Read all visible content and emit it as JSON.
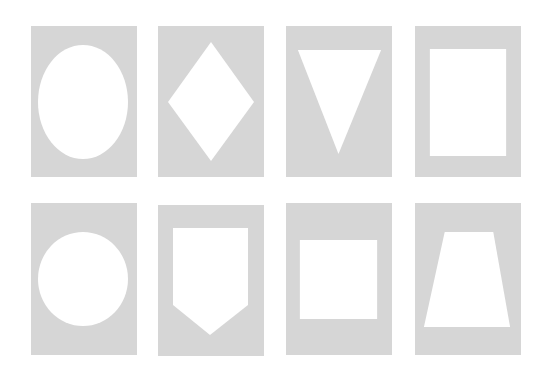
{
  "figure": {
    "background": "#ffffff",
    "card_color": "#d6d6d6",
    "shape_color": "#ffffff",
    "rows": [
      {
        "cards": [
          {
            "shape": "ellipse",
            "label": "oval"
          },
          {
            "shape": "diamond",
            "label": "diamond"
          },
          {
            "shape": "inverted-triangle",
            "label": "inverted triangle"
          },
          {
            "shape": "rectangle",
            "label": "rectangle"
          }
        ]
      },
      {
        "cards": [
          {
            "shape": "circle",
            "label": "circle"
          },
          {
            "shape": "pentagon-shield",
            "label": "shield pentagon"
          },
          {
            "shape": "square",
            "label": "square"
          },
          {
            "shape": "trapezoid",
            "label": "trapezoid"
          }
        ]
      }
    ]
  }
}
